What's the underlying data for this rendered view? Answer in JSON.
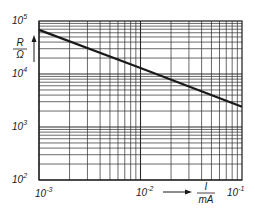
{
  "chart_data": {
    "type": "line",
    "title": "",
    "xlabel": "I / mA",
    "ylabel": "R / Ω",
    "x_scale": "log",
    "y_scale": "log",
    "xlim": [
      0.001,
      0.1
    ],
    "ylim": [
      100,
      100000
    ],
    "grid": true,
    "x_ticks": [
      {
        "base": "10",
        "exp": "-3",
        "value": 0.001
      },
      {
        "base": "10",
        "exp": "-2",
        "value": 0.01
      },
      {
        "base": "10",
        "exp": "-1",
        "value": 0.1
      }
    ],
    "y_ticks": [
      {
        "base": "10",
        "exp": "2",
        "value": 100
      },
      {
        "base": "10",
        "exp": "3",
        "value": 1000
      },
      {
        "base": "10",
        "exp": "4",
        "value": 10000
      },
      {
        "base": "10",
        "exp": "5",
        "value": 100000
      }
    ],
    "series": [
      {
        "name": "R(I)",
        "x": [
          0.001,
          0.01,
          0.1
        ],
        "y": [
          68000,
          13000,
          2400
        ]
      }
    ],
    "axis_labels": {
      "y_num": "R",
      "y_den": "Ω",
      "x_num": "I",
      "x_den": "mA"
    },
    "colors": {
      "line": "#1a1a1a",
      "grid": "#2a2a2a"
    }
  }
}
